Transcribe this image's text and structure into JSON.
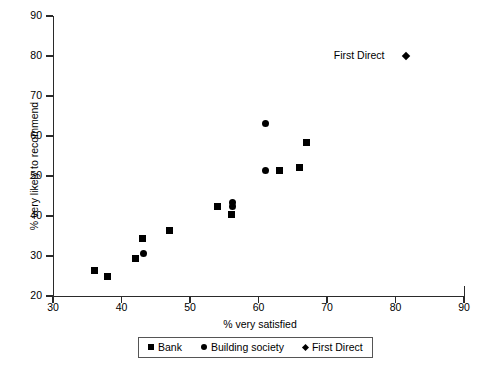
{
  "chart_data": {
    "type": "scatter",
    "title": "",
    "xlabel": "% very satisfied",
    "ylabel": "% very likely to recommend",
    "xlim": [
      30,
      90
    ],
    "ylim": [
      20,
      90
    ],
    "xticks": [
      30,
      40,
      50,
      60,
      70,
      80,
      90
    ],
    "yticks": [
      20,
      30,
      40,
      50,
      60,
      70,
      80,
      90
    ],
    "grid": false,
    "legend_position": "bottom-center",
    "series": [
      {
        "name": "Bank",
        "marker": "square",
        "color": "#000000",
        "points": [
          {
            "x": 36.0,
            "y": 26.5
          },
          {
            "x": 37.9,
            "y": 24.8
          },
          {
            "x": 42.0,
            "y": 29.5
          },
          {
            "x": 43.1,
            "y": 34.5
          },
          {
            "x": 47.0,
            "y": 36.5
          },
          {
            "x": 54.0,
            "y": 42.5
          },
          {
            "x": 56.1,
            "y": 40.5
          },
          {
            "x": 63.0,
            "y": 51.3
          },
          {
            "x": 66.0,
            "y": 52.2
          },
          {
            "x": 67.0,
            "y": 58.3
          }
        ]
      },
      {
        "name": "Building society",
        "marker": "circle",
        "color": "#000000",
        "points": [
          {
            "x": 43.2,
            "y": 30.7
          },
          {
            "x": 56.2,
            "y": 43.4
          },
          {
            "x": 56.2,
            "y": 42.4
          },
          {
            "x": 61.0,
            "y": 63.2
          },
          {
            "x": 61.0,
            "y": 51.3
          }
        ]
      },
      {
        "name": "First Direct",
        "marker": "diamond",
        "color": "#000000",
        "points": [
          {
            "x": 81.5,
            "y": 80.0
          }
        ]
      }
    ],
    "annotations": [
      {
        "text": "First Direct",
        "x": 81.5,
        "y": 80.0,
        "anchor": "right-of-label"
      }
    ]
  },
  "legend": {
    "items": [
      {
        "label": "Bank",
        "marker": "square-marker"
      },
      {
        "label": "Building society",
        "marker": "circle-marker"
      },
      {
        "label": "First Direct",
        "marker": "diamond-marker"
      }
    ]
  }
}
